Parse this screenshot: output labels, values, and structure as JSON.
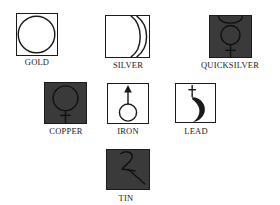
{
  "diagram": {
    "colors": {
      "line": "#1a1a1a",
      "dark_fill": "#3a3a3a",
      "background": "#ffffff"
    },
    "symbols": [
      {
        "label": "GOLD",
        "icon": "sun-circle-icon",
        "filled": false
      },
      {
        "label": "SILVER",
        "icon": "crescent-moon-icon",
        "filled": false
      },
      {
        "label": "QUICKSILVER",
        "icon": "mercury-icon",
        "filled": true
      },
      {
        "label": "COPPER",
        "icon": "venus-icon",
        "filled": true
      },
      {
        "label": "IRON",
        "icon": "mars-icon",
        "filled": false
      },
      {
        "label": "LEAD",
        "icon": "saturn-icon",
        "filled": false
      },
      {
        "label": "TIN",
        "icon": "jupiter-icon",
        "filled": true
      }
    ]
  }
}
